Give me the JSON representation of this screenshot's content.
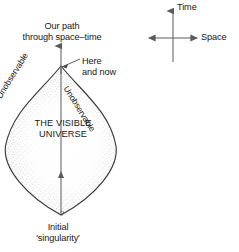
{
  "figure": {
    "labels": {
      "our_path": "Our path\nthrough space–time",
      "here_and_now": "Here\nand now",
      "visible_universe": "THE VISIBLE\nUNIVERSE",
      "initial_singularity": "Initial\n'singularity'",
      "unobservable_left": "Unobservable",
      "unobservable_right": "Unobservable",
      "question_mark": "?"
    },
    "axes": {
      "time_label": "Time",
      "space_label": "Space"
    },
    "colors": {
      "ink": "#171717",
      "line": "#555555",
      "stipple": "#8c8c8c",
      "background": "#ffffff"
    }
  }
}
